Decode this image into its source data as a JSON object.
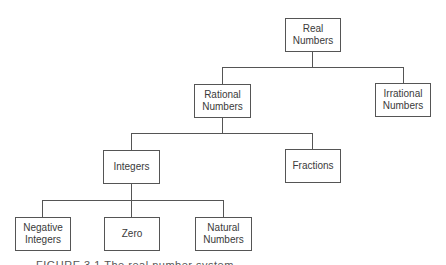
{
  "diagram": {
    "type": "tree",
    "nodes": {
      "real": {
        "label": "Real\nNumbers",
        "line1": "Real",
        "line2": "Numbers"
      },
      "rational": {
        "line1": "Rational",
        "line2": "Numbers"
      },
      "irrational": {
        "line1": "Irrational",
        "line2": "Numbers"
      },
      "integers": {
        "line1": "Integers"
      },
      "fractions": {
        "line1": "Fractions"
      },
      "negative_integers": {
        "line1": "Negative",
        "line2": "Integers"
      },
      "zero": {
        "line1": "Zero"
      },
      "natural_numbers": {
        "line1": "Natural",
        "line2": "Numbers"
      }
    },
    "edges": [
      [
        "real",
        "rational"
      ],
      [
        "real",
        "irrational"
      ],
      [
        "rational",
        "integers"
      ],
      [
        "rational",
        "fractions"
      ],
      [
        "integers",
        "negative_integers"
      ],
      [
        "integers",
        "zero"
      ],
      [
        "integers",
        "natural_numbers"
      ]
    ]
  },
  "caption": {
    "text": "FIGURE 3.1   The real number system"
  }
}
